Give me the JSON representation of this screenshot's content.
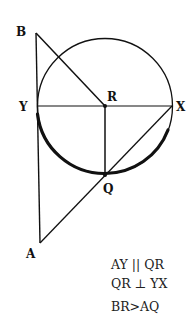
{
  "diagram": {
    "points": {
      "B": {
        "label": "B",
        "x": 36,
        "y": 33
      },
      "Y": {
        "label": "Y",
        "x": 37,
        "y": 106
      },
      "R": {
        "label": "R",
        "x": 105,
        "y": 106
      },
      "X": {
        "label": "X",
        "x": 172,
        "y": 106
      },
      "Q": {
        "label": "Q",
        "x": 105,
        "y": 175
      },
      "A": {
        "label": "A",
        "x": 40,
        "y": 243
      }
    },
    "circle": {
      "center": "R",
      "radius": 68
    },
    "segments": [
      "BR",
      "BA",
      "YX",
      "RQ",
      "XA"
    ],
    "highlighted_arc": "Y to Q (lower arc, thick)",
    "notes": [
      "AY || QR",
      "QR ⊥ YX",
      "BR>AQ"
    ],
    "colors": {
      "ink": "#111111",
      "background": "#ffffff"
    }
  }
}
